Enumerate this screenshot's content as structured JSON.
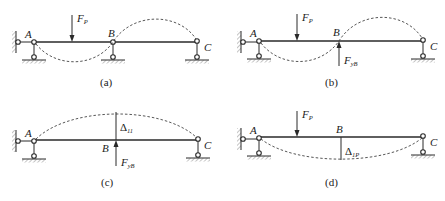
{
  "figure": {
    "panels": [
      {
        "id": "a",
        "caption": "(a)",
        "nodes": {
          "A": "A",
          "B": "B",
          "C": "C"
        },
        "load": {
          "symbol": "F",
          "subscript": "P",
          "direction": "down"
        },
        "deflection": "dashed buckled curve: down between A-B, up between B-C"
      },
      {
        "id": "b",
        "caption": "(b)",
        "nodes": {
          "A": "A",
          "B": "B",
          "C": "C"
        },
        "load": {
          "symbol": "F",
          "subscript": "P",
          "direction": "down"
        },
        "reaction": {
          "symbol": "F",
          "subscript": "yB",
          "direction": "up"
        },
        "deflection": "dashed curve: down between A-B, up between B-C"
      },
      {
        "id": "c",
        "caption": "(c)",
        "nodes": {
          "A": "A",
          "B": "B",
          "C": "C"
        },
        "reaction": {
          "symbol": "F",
          "subscript": "yB",
          "direction": "up"
        },
        "displacement": {
          "symbol": "Δ",
          "subscript": "11"
        },
        "deflection": "dashed arch upward from A to C"
      },
      {
        "id": "d",
        "caption": "(d)",
        "nodes": {
          "A": "A",
          "B": "B",
          "C": "C"
        },
        "load": {
          "symbol": "F",
          "subscript": "P",
          "direction": "down"
        },
        "displacement": {
          "symbol": "Δ",
          "subscript": "1P"
        },
        "deflection": "dashed sag downward from A to C"
      }
    ]
  },
  "colors": {
    "line": "#2a2a2a",
    "background": "#ffffff"
  }
}
